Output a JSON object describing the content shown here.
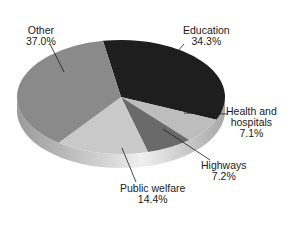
{
  "chart_data": {
    "type": "pie",
    "style": "3d",
    "title": "",
    "categories": [
      "Education",
      "Health and hospitals",
      "Highways",
      "Public welfare",
      "Other"
    ],
    "values": [
      34.3,
      7.1,
      7.2,
      14.4,
      37.0
    ],
    "unit": "%",
    "colors": [
      "#1e1e1e",
      "#bdbdbd",
      "#6a6a6a",
      "#c9c9c9",
      "#8a8a8a"
    ],
    "labels": [
      {
        "name": "Education",
        "value": "34.3%"
      },
      {
        "name": "Health and hospitals",
        "line1": "Health and",
        "line2": "hospitals",
        "value": "7.1%"
      },
      {
        "name": "Highways",
        "value": "7.2%"
      },
      {
        "name": "Public welfare",
        "value": "14.4%"
      },
      {
        "name": "Other",
        "value": "37.0%"
      }
    ],
    "legend": "none (leader-line labels)"
  }
}
